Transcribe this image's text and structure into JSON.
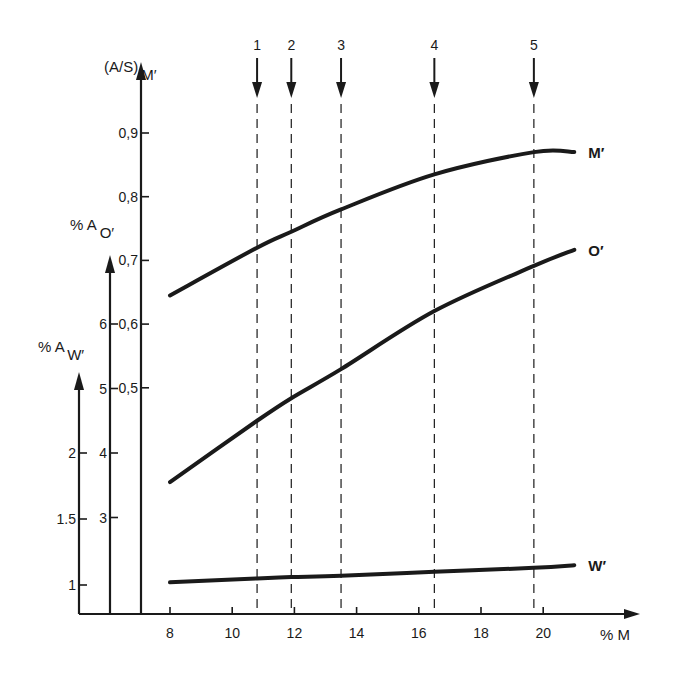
{
  "chart_data": {
    "type": "line",
    "title": "",
    "xlabel": "% M",
    "x_ticks": [
      8,
      10,
      12,
      14,
      16,
      18,
      20
    ],
    "xlim": [
      6.6,
      23.0
    ],
    "y_axes": [
      {
        "id": "M_prime",
        "label_main": "(A/S)",
        "label_sub": "M′",
        "ticks": [
          0.5,
          0.6,
          0.7,
          0.8,
          0.9
        ],
        "tick_labels": [
          "0,5",
          "0,6",
          "0,7",
          "0,8",
          "0,9"
        ]
      },
      {
        "id": "O_prime",
        "label_main": "% A",
        "label_sub": "O′",
        "ticks": [
          3,
          4,
          5,
          6
        ],
        "tick_labels": [
          "3",
          "4",
          "5",
          "6"
        ]
      },
      {
        "id": "W_prime",
        "label_main": "% A",
        "label_sub": "W′",
        "ticks": [
          1,
          1.5,
          2
        ],
        "tick_labels": [
          "1",
          "1.5",
          "2"
        ]
      }
    ],
    "series": [
      {
        "name": "M′",
        "axis": "M_prime",
        "x": [
          8.0,
          10.8,
          11.9,
          13.5,
          16.5,
          19.7,
          21.0
        ],
        "y": [
          0.645,
          0.72,
          0.745,
          0.78,
          0.835,
          0.87,
          0.87
        ]
      },
      {
        "name": "O′",
        "axis": "O_prime",
        "x": [
          8.0,
          10.8,
          11.9,
          13.5,
          16.5,
          19.7,
          21.0
        ],
        "y": [
          3.55,
          4.5,
          4.85,
          5.3,
          6.2,
          6.9,
          7.15
        ]
      },
      {
        "name": "W′",
        "axis": "W_prime",
        "x": [
          8.0,
          10.8,
          11.9,
          13.5,
          16.5,
          19.7,
          21.0
        ],
        "y": [
          1.02,
          1.05,
          1.06,
          1.07,
          1.1,
          1.13,
          1.15
        ]
      }
    ],
    "markers": [
      {
        "label": "1",
        "x": 10.8
      },
      {
        "label": "2",
        "x": 11.9
      },
      {
        "label": "3",
        "x": 13.5
      },
      {
        "label": "4",
        "x": 16.5
      },
      {
        "label": "5",
        "x": 19.7
      }
    ],
    "grid": false,
    "legend": "inline labels at right end of curves"
  }
}
